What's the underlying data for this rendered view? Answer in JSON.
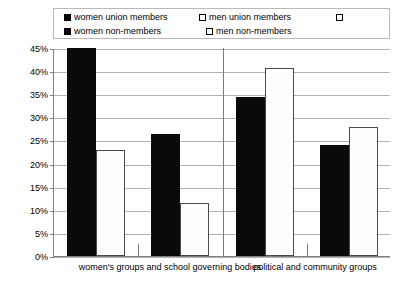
{
  "legend": {
    "rows": [
      [
        {
          "swatch": "filled",
          "label": "women union members"
        },
        {
          "swatch": "hollow",
          "label": "men union members"
        },
        {
          "swatch": "hollow",
          "label": ""
        }
      ],
      [
        {
          "swatch": "filled",
          "label": "women non-members"
        },
        {
          "swatch": "hollow",
          "label": "men non-members"
        }
      ]
    ]
  },
  "axis": {
    "y_ticks": [
      "45%",
      "40%",
      "35%",
      "30%",
      "25%",
      "20%",
      "15%",
      "10%",
      "5%",
      "0%"
    ],
    "x_labels": [
      "women's groups and school governing bodies",
      "political and community groups"
    ]
  },
  "chart_data": {
    "type": "bar",
    "title": "",
    "xlabel": "",
    "ylabel": "",
    "ylim": [
      0,
      45
    ],
    "ytick_step": 5,
    "grid": true,
    "legend_position": "top",
    "categories": [
      "women's groups and school governing bodies",
      "political and community groups"
    ],
    "groups": [
      {
        "category": "women's groups and school governing bodies",
        "subgroup": "union members",
        "bars": [
          {
            "series": "women union members",
            "value": 45.0,
            "style": "filled"
          },
          {
            "series": "men union members",
            "value": 23.0,
            "style": "hollow"
          }
        ]
      },
      {
        "category": "women's groups and school governing bodies",
        "subgroup": "non-members",
        "bars": [
          {
            "series": "women non-members",
            "value": 26.5,
            "style": "filled"
          },
          {
            "series": "men non-members",
            "value": 11.5,
            "style": "hollow"
          }
        ]
      },
      {
        "category": "political and community groups",
        "subgroup": "union members",
        "bars": [
          {
            "series": "women union members",
            "value": 34.5,
            "style": "filled"
          },
          {
            "series": "men union members",
            "value": 40.7,
            "style": "hollow"
          }
        ]
      },
      {
        "category": "political and community groups",
        "subgroup": "non-members",
        "bars": [
          {
            "series": "women non-members",
            "value": 24.0,
            "style": "filled"
          },
          {
            "series": "men non-members",
            "value": 28.0,
            "style": "hollow"
          }
        ]
      }
    ],
    "series": [
      {
        "name": "women union members",
        "style": "filled",
        "values": [
          45.0,
          34.5
        ]
      },
      {
        "name": "men union members",
        "style": "hollow",
        "values": [
          23.0,
          40.7
        ]
      },
      {
        "name": "women non-members",
        "style": "filled",
        "values": [
          26.5,
          24.0
        ]
      },
      {
        "name": "men non-members",
        "style": "hollow",
        "values": [
          11.5,
          28.0
        ]
      }
    ],
    "colors": {
      "filled": "#000000",
      "hollow": "#ffffff",
      "outline": "#4a4a4a",
      "grid": "#b0b0b0",
      "axis": "#808080"
    }
  }
}
